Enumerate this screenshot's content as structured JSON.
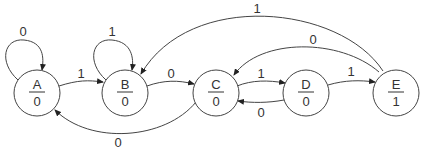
{
  "diagram": {
    "type": "moore_state_machine",
    "states": [
      {
        "id": "A",
        "name": "A",
        "output": "0",
        "cx": 37,
        "cy": 93
      },
      {
        "id": "B",
        "name": "B",
        "output": "0",
        "cx": 125,
        "cy": 93
      },
      {
        "id": "C",
        "name": "C",
        "output": "0",
        "cx": 216,
        "cy": 93
      },
      {
        "id": "D",
        "name": "D",
        "output": "0",
        "cx": 306,
        "cy": 93
      },
      {
        "id": "E",
        "name": "E",
        "output": "1",
        "cx": 396,
        "cy": 93
      }
    ],
    "transitions": [
      {
        "from": "A",
        "to": "A",
        "input": "0"
      },
      {
        "from": "A",
        "to": "B",
        "input": "1"
      },
      {
        "from": "B",
        "to": "B",
        "input": "1"
      },
      {
        "from": "B",
        "to": "C",
        "input": "0"
      },
      {
        "from": "C",
        "to": "A",
        "input": "0"
      },
      {
        "from": "C",
        "to": "D",
        "input": "1"
      },
      {
        "from": "D",
        "to": "C",
        "input": "0"
      },
      {
        "from": "D",
        "to": "E",
        "input": "1"
      },
      {
        "from": "E",
        "to": "C",
        "input": "0"
      },
      {
        "from": "E",
        "to": "B",
        "input": "1"
      }
    ]
  }
}
